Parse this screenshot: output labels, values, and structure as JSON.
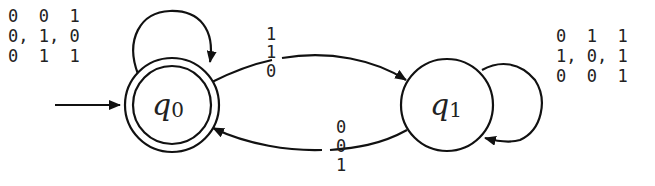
{
  "diagram": {
    "type": "finite-automaton",
    "states": [
      {
        "id": "q0",
        "name": "q",
        "subscript": "0",
        "accepting": true,
        "initial": true
      },
      {
        "id": "q1",
        "name": "q",
        "subscript": "1",
        "accepting": false,
        "initial": false
      }
    ],
    "transitions": {
      "q0_self": {
        "from": "q0",
        "to": "q0",
        "label_rows": [
          [
            "0",
            " ",
            "0",
            " ",
            "1"
          ],
          [
            "0",
            ",",
            "1",
            ",",
            "0"
          ],
          [
            "0",
            " ",
            "1",
            " ",
            "1"
          ]
        ],
        "row0": "0  0  1",
        "row1": "0, 1, 0",
        "row2": "0  1  1"
      },
      "q1_self": {
        "from": "q1",
        "to": "q1",
        "row0": "0  1  1",
        "row1": "1, 0, 1",
        "row2": "0  0  1"
      },
      "q0_to_q1": {
        "from": "q0",
        "to": "q1",
        "row0": "1",
        "row1": "1",
        "row2": "0"
      },
      "q1_to_q0": {
        "from": "q1",
        "to": "q0",
        "row0": "0",
        "row1": "0",
        "row2": "1"
      }
    },
    "colors": {
      "stroke": "#111111",
      "text": "#222222",
      "background": "#ffffff"
    }
  }
}
